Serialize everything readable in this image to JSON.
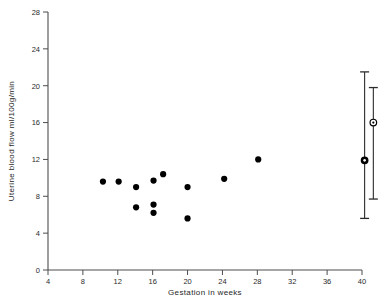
{
  "chart_data": {
    "type": "scatter",
    "title": "",
    "xlabel": "Gestation in weeks",
    "ylabel": "Uterine blood flow  ml/100g/min",
    "xlim": [
      4,
      42
    ],
    "ylim": [
      0,
      28
    ],
    "xticks": [
      4,
      8,
      12,
      16,
      20,
      24,
      28,
      32,
      36,
      40
    ],
    "xtick_labels": [
      "4",
      "8",
      "12",
      "16",
      "20",
      "24",
      "28",
      "32",
      "36",
      "40"
    ],
    "yticks": [
      0,
      4,
      8,
      12,
      16,
      20,
      24,
      28
    ],
    "ytick_labels": [
      "0",
      "4",
      "8",
      "12",
      "16",
      "20",
      "24",
      "28"
    ],
    "grid": false,
    "legend": "none",
    "series": [
      {
        "name": "Individual measurements",
        "marker": "filled-circle",
        "color": "#000000",
        "points": [
          {
            "x": 10.3,
            "y": 9.6
          },
          {
            "x": 12.1,
            "y": 9.6
          },
          {
            "x": 14.1,
            "y": 9.0
          },
          {
            "x": 14.1,
            "y": 6.8
          },
          {
            "x": 16.1,
            "y": 9.7
          },
          {
            "x": 16.1,
            "y": 7.1
          },
          {
            "x": 16.1,
            "y": 6.2
          },
          {
            "x": 17.2,
            "y": 10.4
          },
          {
            "x": 20.0,
            "y": 9.0
          },
          {
            "x": 20.0,
            "y": 5.6
          },
          {
            "x": 24.2,
            "y": 9.9
          },
          {
            "x": 28.1,
            "y": 12.0
          }
        ]
      }
    ],
    "error_bars": [
      {
        "name": "term-group-1",
        "x": 40.3,
        "y": 11.9,
        "low": 5.6,
        "high": 21.5,
        "marker": "filled-circle-open-ring"
      },
      {
        "name": "term-group-2",
        "x": 41.3,
        "y": 16.0,
        "low": 7.7,
        "high": 19.8,
        "marker": "open-circle"
      }
    ]
  },
  "axes": {
    "x_axis_title": "Gestation in weeks",
    "y_axis_title": "Uterine blood flow  ml/100g/min"
  }
}
